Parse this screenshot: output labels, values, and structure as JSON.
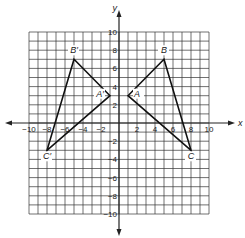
{
  "diagram": {
    "type": "coordinate-grid-reflection",
    "axes": {
      "x_label": "x",
      "y_label": "y",
      "x_range": [
        -10,
        10
      ],
      "y_range": [
        -10,
        10
      ],
      "x_ticks": [
        "−10",
        "−8",
        "−6",
        "−4",
        "−2",
        "2",
        "4",
        "6",
        "8",
        "10"
      ],
      "y_ticks": [
        "10",
        "8",
        "6",
        "4",
        "2",
        "−2",
        "−4",
        "−6",
        "−8",
        "−10"
      ]
    },
    "triangles": [
      {
        "name": "ABC",
        "vertices": [
          {
            "label": "A",
            "x": 1,
            "y": 3
          },
          {
            "label": "B",
            "x": 5,
            "y": 7
          },
          {
            "label": "C",
            "x": 8,
            "y": -3
          }
        ]
      },
      {
        "name": "A'B'C'",
        "vertices": [
          {
            "label": "A′",
            "x": -1,
            "y": 3
          },
          {
            "label": "B′",
            "x": -5,
            "y": 7
          },
          {
            "label": "C′",
            "x": -8,
            "y": -3
          }
        ]
      }
    ],
    "colors": {
      "grid": "#333333",
      "axis": "#222222",
      "triangle": "#111111",
      "background": "#ffffff"
    }
  }
}
